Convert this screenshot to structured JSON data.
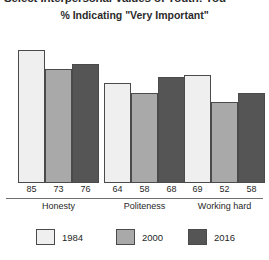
{
  "title": "Select Interpersonal Values of Youth: You",
  "subtitle": "% Indicating \"Very Important\"",
  "chart_data": {
    "type": "bar",
    "title": "Select Interpersonal Values of Youth: You",
    "subtitle": "% Indicating \"Very Important\"",
    "xlabel": "",
    "ylabel": "% Indicating \"Very Important\"",
    "ylim": [
      0,
      100
    ],
    "grid": false,
    "legend_position": "bottom",
    "categories": [
      "Honesty",
      "Politeness",
      "Working hard"
    ],
    "series": [
      {
        "name": "1984",
        "color": "#efefef",
        "values": [
          85,
          64,
          69
        ]
      },
      {
        "name": "2000",
        "color": "#a9a9a9",
        "values": [
          73,
          58,
          52
        ]
      },
      {
        "name": "2016",
        "color": "#555555",
        "values": [
          76,
          68,
          58
        ]
      }
    ]
  },
  "legend": {
    "items": [
      {
        "label": "1984",
        "color": "#efefef"
      },
      {
        "label": "2000",
        "color": "#a9a9a9"
      },
      {
        "label": "2016",
        "color": "#555555"
      }
    ]
  },
  "value_labels": {
    "honesty": [
      "85",
      "73",
      "76"
    ],
    "politeness": [
      "64",
      "58",
      "68"
    ],
    "working_hard": [
      "69",
      "52",
      "58"
    ]
  },
  "category_labels": [
    "Honesty",
    "Politeness",
    "Working hard"
  ]
}
